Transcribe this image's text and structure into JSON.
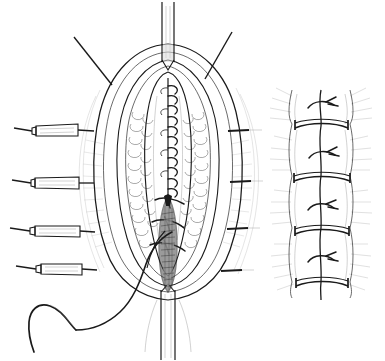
{
  "figure": {
    "kind": "line-drawing",
    "width": 385,
    "height": 361,
    "background_color": "#ffffff",
    "ink_color": "#1a1a1a",
    "shading_color": "#8d8d8d",
    "caption": ""
  },
  "panels": [
    {
      "id": "main-panel",
      "name": "open-wound-view",
      "label": "",
      "description": "Midline incision held open, running suture in deep layer, tube exiting at top and bottom"
    },
    {
      "id": "inset-panel",
      "name": "closed-incision-inset",
      "label": "",
      "description": "Closed incision with interrupted sutures and transverse bands"
    }
  ],
  "main_panel": {
    "wound": {
      "name": "midline-incision",
      "center_x": 168,
      "top_y": 58,
      "bottom_y": 300,
      "half_width": 72
    },
    "tubes": [
      {
        "name": "tube-superior",
        "x": 168,
        "y_top": 2,
        "y_bottom": 62,
        "width": 12
      },
      {
        "name": "tube-inferior",
        "x": 168,
        "y_top": 288,
        "y_bottom": 360,
        "width": 13
      }
    ],
    "running_suture": {
      "name": "continuous-running-suture",
      "stitch_count": 12,
      "x": 168,
      "y_start": 84,
      "y_end": 196,
      "spacing": 10.2
    },
    "interrupted_sutures": {
      "name": "interrupted-suture-group",
      "count": 3,
      "y_values": [
        203,
        225,
        247
      ]
    },
    "exposed_tissue": {
      "name": "exposed-deep-tissue",
      "x": 168,
      "y_top": 236,
      "y_bottom": 290,
      "shading": "crosshatch"
    },
    "suture_thread": {
      "name": "suture-thread",
      "description": "long thread from wound curving down and left to the needle"
    },
    "needle": {
      "name": "curved-surgical-needle",
      "cx": 52,
      "cy": 322,
      "radius": 22,
      "description": "curved needle at free end of suture thread"
    }
  },
  "clamps": {
    "name": "hemostat-clamp-group",
    "count": 4,
    "items": [
      {
        "name": "clamp-1",
        "x": 14,
        "y": 131,
        "length": 58,
        "angle": -2
      },
      {
        "name": "clamp-2",
        "x": 12,
        "y": 183,
        "length": 60,
        "angle": -1
      },
      {
        "name": "clamp-3",
        "x": 10,
        "y": 232,
        "length": 62,
        "angle": -1
      },
      {
        "name": "clamp-4",
        "x": 16,
        "y": 270,
        "length": 56,
        "angle": -1
      }
    ]
  },
  "retractors": {
    "name": "retraction-marker-group",
    "top": [
      {
        "name": "retractor-top-left",
        "x1": 74,
        "y1": 37,
        "x2": 112,
        "y2": 85
      },
      {
        "name": "retractor-top-right",
        "x1": 230,
        "y1": 32,
        "x2": 206,
        "y2": 80
      }
    ],
    "right": [
      {
        "name": "retractor-right-1",
        "x1": 228,
        "y1": 131,
        "x2": 258,
        "y2": 130
      },
      {
        "name": "retractor-right-2",
        "x1": 229,
        "y1": 182,
        "x2": 259,
        "y2": 181
      },
      {
        "name": "retractor-right-3",
        "x1": 227,
        "y1": 229,
        "x2": 257,
        "y2": 228
      },
      {
        "name": "retractor-right-4",
        "x1": 222,
        "y1": 271,
        "x2": 252,
        "y2": 270
      }
    ]
  },
  "inset_panel": {
    "name": "closed-incision-inset",
    "x_center": 321,
    "y_top": 88,
    "y_bottom": 300,
    "half_width": 30,
    "incision_line": {
      "name": "closed-incision-line",
      "x": 321
    },
    "transverse_bands": {
      "name": "transverse-band-group",
      "count": 4,
      "y_values": [
        125,
        177,
        230,
        281
      ]
    },
    "knots": {
      "name": "suture-knot-group",
      "count": 4,
      "y_values": [
        104,
        153,
        206,
        258
      ]
    },
    "hatching": {
      "name": "radial-hatching",
      "style": "outward-fan"
    }
  }
}
